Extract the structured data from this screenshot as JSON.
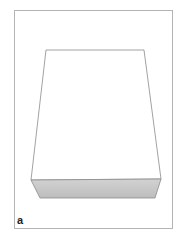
{
  "figure": {
    "panel_label": "a",
    "colors": {
      "frame_border": "#b4b4b4",
      "edge": "#8a8a8a",
      "top_face": "#ffffff",
      "front_face": "#c8c8c8"
    }
  }
}
